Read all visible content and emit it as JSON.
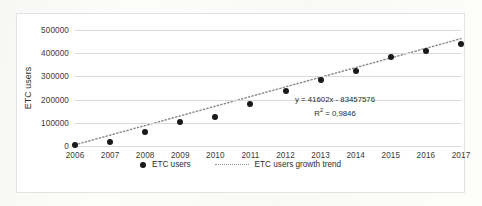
{
  "chart_data": {
    "type": "scatter",
    "title": "",
    "xlabel": "",
    "ylabel": "ETC users",
    "categories": [
      "2006",
      "2007",
      "2008",
      "2009",
      "2010",
      "2011",
      "2012",
      "2013",
      "2014",
      "2015",
      "2016",
      "2017"
    ],
    "x": [
      2006,
      2007,
      2008,
      2009,
      2010,
      2011,
      2012,
      2013,
      2014,
      2015,
      2016,
      2017
    ],
    "series": [
      {
        "name": "ETC users",
        "values": [
          3000,
          18000,
          62000,
          105000,
          126000,
          180000,
          238000,
          285000,
          325000,
          385000,
          410000,
          440000
        ]
      },
      {
        "name": "ETC users growth trend",
        "type": "line",
        "style": "dotted",
        "equation": "y = 41602x - 83457576",
        "slope": 41602,
        "intercept": -83457576,
        "r_squared": "0,9846",
        "values": [
          5136,
          46738,
          88340,
          129942,
          171544,
          213146,
          254748,
          296350,
          337952,
          379554,
          421156,
          462758
        ]
      }
    ],
    "ylim": [
      0,
      500000
    ],
    "yticks": [
      "0",
      "100000",
      "200000",
      "300000",
      "400000",
      "500000"
    ],
    "ytick_values": [
      0,
      100000,
      200000,
      300000,
      400000,
      500000
    ],
    "xlim": [
      2006,
      2017
    ],
    "grid": "horizontal",
    "legend_position": "bottom",
    "annotations": [
      {
        "text_line1": "y = 41602x - 83457576",
        "text_line2_prefix": "R",
        "text_line2_sup": "2",
        "text_line2_suffix": " = 0,9846"
      }
    ],
    "colors": {
      "marker": "#1a1a1a",
      "trendline": "#8e8e8e",
      "gridline": "#d9d9d7",
      "background": "#ffffff"
    }
  },
  "legend": {
    "items": [
      {
        "label": "ETC users",
        "marker": "dot-marker"
      },
      {
        "label": "ETC users growth trend",
        "marker": "dotted-line-marker"
      }
    ]
  },
  "equation_text": {
    "line1": "y = 41602x - 83457576",
    "r_label": "R",
    "r_exponent": "2",
    "r_value": " = 0,9846"
  }
}
